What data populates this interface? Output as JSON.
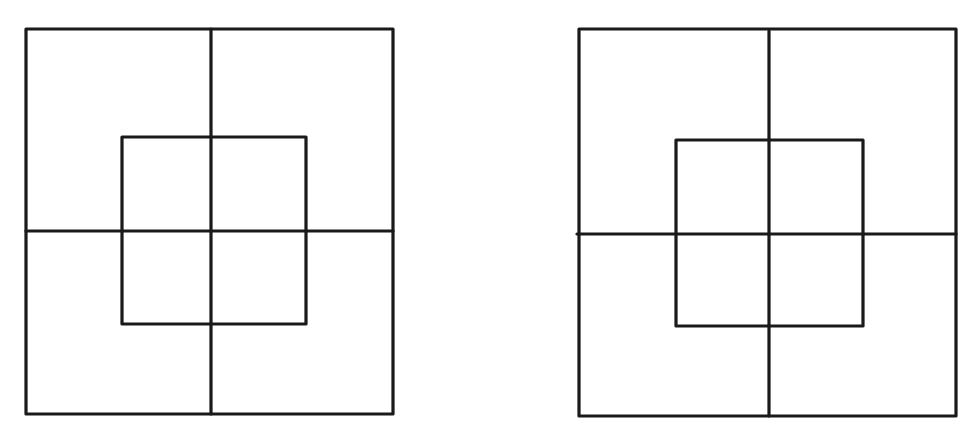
{
  "canvas": {
    "width": 972,
    "height": 433,
    "background": "#ffffff",
    "stroke_color": "#1a1a1a"
  },
  "figures": [
    {
      "id": "left",
      "outer_square": {
        "x1": 26,
        "y1": 29,
        "x2": 393,
        "y2": 414
      },
      "vertical_line": {
        "x": 211,
        "y1": 29,
        "y2": 414
      },
      "horizontal_line": {
        "y": 231,
        "x1": 26,
        "x2": 393
      },
      "inner_square": {
        "x1": 122,
        "y1": 137,
        "x2": 306,
        "y2": 324
      }
    },
    {
      "id": "right",
      "outer_square": {
        "x1": 579,
        "y1": 29,
        "x2": 956,
        "y2": 416
      },
      "vertical_line": {
        "x": 769,
        "y1": 31,
        "y2": 416
      },
      "horizontal_line": {
        "y": 234,
        "x1": 577,
        "x2": 956
      },
      "inner_square": {
        "x1": 676,
        "y1": 140,
        "x2": 863,
        "y2": 326
      }
    }
  ]
}
